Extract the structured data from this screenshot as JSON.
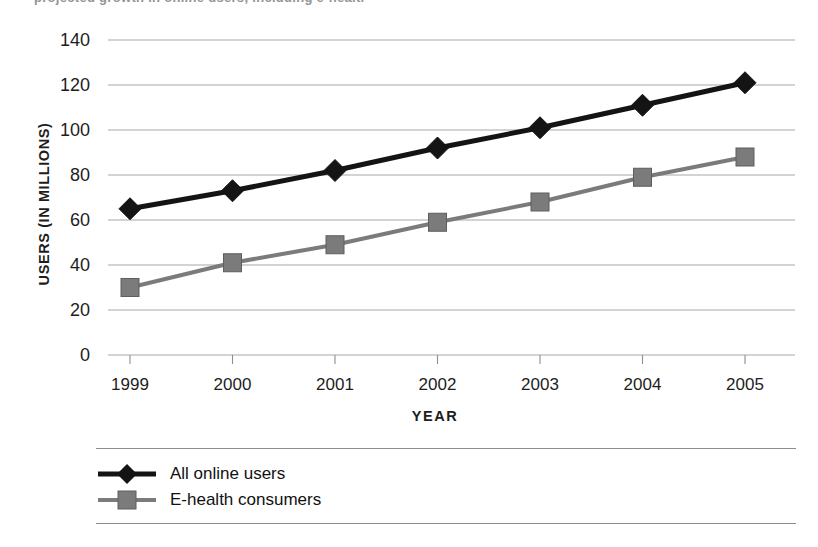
{
  "caption_sliver": "projected growth in online users, including e-health",
  "chart_data": {
    "type": "line",
    "title": "",
    "xlabel": "YEAR",
    "ylabel": "USERS (IN MILLIONS)",
    "categories": [
      "1999",
      "2000",
      "2001",
      "2002",
      "2003",
      "2004",
      "2005"
    ],
    "ylim": [
      0,
      140
    ],
    "yticks": [
      0,
      20,
      40,
      60,
      80,
      100,
      120,
      140
    ],
    "ytick_labels": [
      "0",
      "20",
      "40",
      "60",
      "80",
      "100",
      "120",
      "140"
    ],
    "grid": "horizontal",
    "legend_position": "bottom-left",
    "series": [
      {
        "name": "All online users",
        "values": [
          65,
          73,
          82,
          92,
          101,
          111,
          121
        ],
        "color": "#141414",
        "marker": "diamond"
      },
      {
        "name": "E-health consumers",
        "values": [
          30,
          41,
          49,
          59,
          68,
          79,
          88
        ],
        "color": "#7b7b7b",
        "marker": "square"
      }
    ]
  },
  "colors": {
    "background": "#ffffff",
    "gridline": "#a8a8a8",
    "axis": "#8d8d8d",
    "text": "#1d1d1d",
    "series_all_online_users": "#141414",
    "series_ehealth_consumers": "#7b7b7b"
  }
}
